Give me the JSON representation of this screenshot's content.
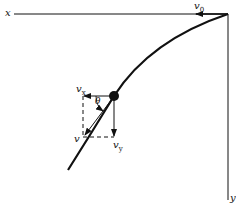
{
  "diagram": {
    "type": "projectile-motion-vector-diagram",
    "axes": {
      "x_label": "x",
      "y_label": "y"
    },
    "vectors": {
      "initial_velocity": {
        "symbol": "v",
        "subscript": "0"
      },
      "horizontal_component": {
        "symbol": "v",
        "subscript": "x"
      },
      "vertical_component": {
        "symbol": "v",
        "subscript": "y"
      },
      "resultant": {
        "symbol": "v",
        "subscript": ""
      }
    },
    "angle_label": "θ",
    "colors": {
      "stroke": "#111111",
      "background": "#ffffff"
    }
  }
}
